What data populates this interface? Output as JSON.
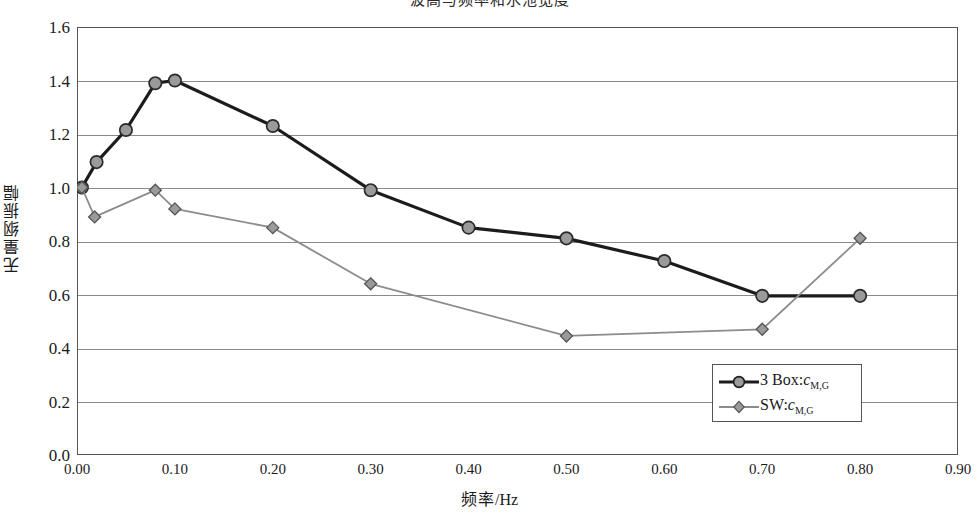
{
  "title": "波高与频率和水池宽度",
  "axes": {
    "ylabel": "无量纲振幅",
    "xlabel_main": "频率",
    "xlabel_unit": "/Hz",
    "yticks": [
      "0.0",
      "0.2",
      "0.4",
      "0.6",
      "0.8",
      "1.0",
      "1.2",
      "1.4",
      "1.6"
    ],
    "xticks": [
      "0.00",
      "0.10",
      "0.20",
      "0.30",
      "0.40",
      "0.50",
      "0.60",
      "0.70",
      "0.80",
      "0.90"
    ]
  },
  "legend": {
    "items": [
      {
        "label_main": "3 Box:",
        "label_var": "c",
        "label_sub": "M,G",
        "marker": "circle-marker",
        "color": "#1c1c1c"
      },
      {
        "label_main": "SW:",
        "label_var": "c",
        "label_sub": "M,G",
        "marker": "diamond-marker",
        "color": "#8c8c8c"
      }
    ]
  },
  "colors": {
    "series_3box": "#1c1c1c",
    "series_sw": "#8c8c8c",
    "marker_fill": "#9a9a9a",
    "gridline": "#8a8a8a",
    "frame": "#555555"
  },
  "chart_data": {
    "type": "line",
    "title": "波高与频率和水池宽度",
    "xlabel": "频率/Hz",
    "ylabel": "无量纲振幅",
    "xlim": [
      0.0,
      0.9
    ],
    "ylim": [
      0.0,
      1.6
    ],
    "grid": true,
    "legend_position": "inside-bottom-right",
    "series": [
      {
        "name": "3 Box:c_M,G",
        "marker": "circle",
        "color": "#1c1c1c",
        "points": [
          {
            "x": 0.005,
            "y": 1.0
          },
          {
            "x": 0.02,
            "y": 1.095
          },
          {
            "x": 0.05,
            "y": 1.215
          },
          {
            "x": 0.08,
            "y": 1.39
          },
          {
            "x": 0.1,
            "y": 1.4
          },
          {
            "x": 0.2,
            "y": 1.23
          },
          {
            "x": 0.3,
            "y": 0.99
          },
          {
            "x": 0.4,
            "y": 0.85
          },
          {
            "x": 0.5,
            "y": 0.81
          },
          {
            "x": 0.6,
            "y": 0.725
          },
          {
            "x": 0.7,
            "y": 0.595
          },
          {
            "x": 0.8,
            "y": 0.595
          }
        ]
      },
      {
        "name": "SW:c_M,G",
        "marker": "diamond",
        "color": "#8c8c8c",
        "points": [
          {
            "x": 0.005,
            "y": 1.0
          },
          {
            "x": 0.018,
            "y": 0.89
          },
          {
            "x": 0.08,
            "y": 0.99
          },
          {
            "x": 0.1,
            "y": 0.92
          },
          {
            "x": 0.2,
            "y": 0.85
          },
          {
            "x": 0.3,
            "y": 0.64
          },
          {
            "x": 0.5,
            "y": 0.445
          },
          {
            "x": 0.7,
            "y": 0.47
          },
          {
            "x": 0.8,
            "y": 0.81
          }
        ]
      }
    ]
  }
}
